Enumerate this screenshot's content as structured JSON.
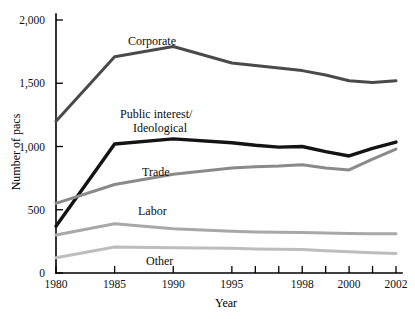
{
  "chart_data": {
    "type": "line",
    "title": "",
    "xlabel": "Year",
    "ylabel": "Number of pacs",
    "grid": false,
    "legend_position": "inline-labels",
    "ylim": [
      0,
      2000
    ],
    "yticks": [
      0,
      500,
      1000,
      1500,
      2000
    ],
    "ytick_labels": [
      "0",
      "500",
      "1,000",
      "1,500",
      "2,000"
    ],
    "x": [
      1980,
      1985,
      1990,
      1995,
      1996,
      1997,
      1998,
      1999,
      2000,
      2001,
      2002
    ],
    "xticks": [
      1980,
      1985,
      1990,
      1995,
      1996,
      1997,
      1998,
      1999,
      2000,
      2001,
      2002
    ],
    "xtick_labels": [
      "1980",
      "1985",
      "1990",
      "1995",
      "",
      "",
      "1998",
      "",
      "2000",
      "",
      "2002"
    ],
    "series": [
      {
        "name": "Corporate",
        "color": "#4a4a4a",
        "width": 3.0,
        "values": [
          1200,
          1710,
          1790,
          1660,
          1640,
          1620,
          1600,
          1565,
          1520,
          1505,
          1520
        ]
      },
      {
        "name": "Public interest/\nIdeological",
        "color": "#141414",
        "width": 3.4,
        "values": [
          370,
          1020,
          1060,
          1030,
          1010,
          995,
          1000,
          960,
          925,
          985,
          1035
        ]
      },
      {
        "name": "Trade",
        "color": "#8a8a8a",
        "width": 3.0,
        "values": [
          550,
          700,
          780,
          830,
          840,
          845,
          855,
          830,
          815,
          900,
          980
        ]
      },
      {
        "name": "Labor",
        "color": "#a8a8a8",
        "width": 3.0,
        "values": [
          300,
          390,
          350,
          330,
          325,
          322,
          320,
          316,
          312,
          310,
          310
        ]
      },
      {
        "name": "Other",
        "color": "#bdbdbd",
        "width": 3.0,
        "values": [
          120,
          205,
          200,
          195,
          190,
          188,
          185,
          175,
          168,
          160,
          155
        ]
      }
    ],
    "series_labels": [
      {
        "text": "Corporate",
        "x": 128,
        "y": 45
      },
      {
        "text": "Public interest/",
        "x": 120,
        "y": 118
      },
      {
        "text": "Ideological",
        "x": 133,
        "y": 132
      },
      {
        "text": "Trade",
        "x": 142,
        "y": 176
      },
      {
        "text": "Labor",
        "x": 138,
        "y": 215
      },
      {
        "text": "Other",
        "x": 146,
        "y": 265
      }
    ]
  }
}
